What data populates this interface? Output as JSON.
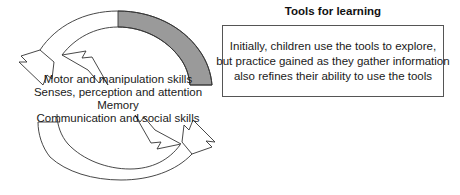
{
  "diagram": {
    "skills": [
      {
        "label": "Motor and manipulation skills"
      },
      {
        "label": "Senses, perception and attention"
      },
      {
        "label": "Memory"
      },
      {
        "label": "Communication and social skills"
      }
    ],
    "arrows": {
      "upper": {
        "name": "upper-cycle-arrow",
        "direction": "right-to-left"
      },
      "lower": {
        "name": "lower-cycle-arrow",
        "direction": "left-to-right"
      }
    },
    "colors": {
      "shaded_segment": "#9a9a9a",
      "outline": "#333333",
      "box_border": "#555555",
      "text": "#1a1a1a",
      "background": "#ffffff"
    }
  },
  "panel": {
    "title": "Tools for learning",
    "body_lines": [
      "Initially, children use the tools to explore,",
      "but practice gained as they gather information",
      "also refines their ability to use the tools"
    ]
  }
}
